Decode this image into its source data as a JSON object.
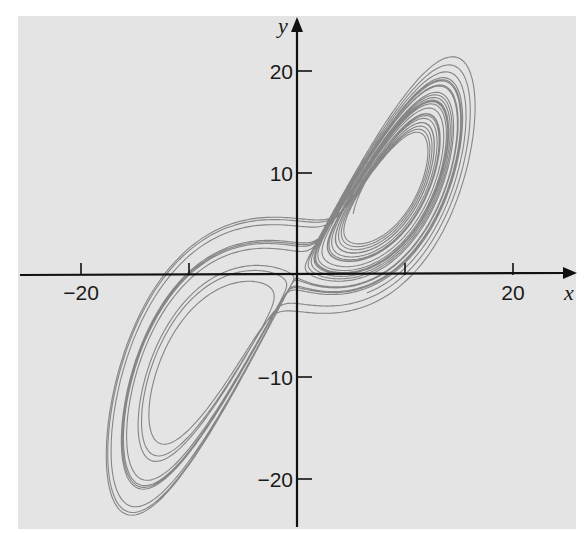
{
  "chart_data": {
    "type": "line",
    "title": "",
    "xlabel": "x",
    "ylabel": "y",
    "xlim": [
      -26,
      25
    ],
    "ylim": [
      -25,
      26
    ],
    "grid": false,
    "legend": null,
    "x_ticks": [
      {
        "value": -20,
        "label": "−20",
        "show_label": true
      },
      {
        "value": -10,
        "label": "",
        "show_label": false
      },
      {
        "value": 10,
        "label": "",
        "show_label": false
      },
      {
        "value": 20,
        "label": "20",
        "show_label": true
      }
    ],
    "y_ticks": [
      {
        "value": 20,
        "label": "20"
      },
      {
        "value": 10,
        "label": "10"
      },
      {
        "value": -10,
        "label": "−10"
      },
      {
        "value": -20,
        "label": "−20"
      }
    ],
    "series": [
      {
        "name": "trajectory",
        "kind": "lorenz-system",
        "params": {
          "sigma": 10,
          "rho": 28,
          "beta": 2.6667
        },
        "initial": {
          "x": 5.2,
          "y": 6.0,
          "z": 18.0
        },
        "dt": 0.004,
        "steps": 6500,
        "color": "#7a7a7a"
      }
    ],
    "observed_extent": {
      "right_lobe_top": [
        19.7,
        24.5
      ],
      "left_lobe_bottom": [
        -16.0,
        -21.8
      ],
      "trajectory_start": [
        5.2,
        6.0
      ]
    }
  },
  "colors": {
    "panel": "#e4e4e4",
    "axis": "#111111",
    "curve": "#7a7a7a",
    "page": "#ffffff"
  }
}
